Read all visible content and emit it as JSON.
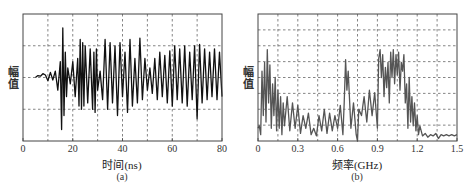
{
  "chart_data": [
    {
      "type": "line",
      "title": "",
      "panel_label": "(a)",
      "xlabel": "时间(ns)",
      "ylabel": "幅值",
      "xlim": [
        0,
        80
      ],
      "ylim": [
        -1,
        1
      ],
      "xticks": [
        "0",
        "20",
        "40",
        "60",
        "80"
      ],
      "xtick_values": [
        0,
        20,
        40,
        60,
        80
      ],
      "x_grid": [
        10,
        20,
        30,
        40,
        50,
        60,
        70
      ],
      "y_grid": [
        -0.5,
        0,
        0.5
      ],
      "grid": true,
      "line_color": "#111111",
      "description": "Time-domain waveform starting ~5 ns, small amplitude until ~14 ns, large burst ~15-17 ns (peak ~+0.78, trough ~-0.82), then sustained oscillations ±0.5 to 0.7 until 80 ns",
      "x": [
        5,
        6,
        7,
        8,
        9,
        10,
        11,
        12,
        13,
        14,
        15,
        15.5,
        16,
        16.5,
        17,
        17.5,
        18,
        19,
        20,
        21,
        22,
        22.5,
        23,
        23.5,
        24,
        24.5,
        25,
        26,
        27,
        28,
        28.5,
        29,
        29.5,
        30,
        31,
        32,
        33,
        34,
        35,
        36,
        37,
        38,
        39,
        40,
        41,
        42,
        43,
        44,
        45,
        46,
        47,
        48,
        49,
        50,
        51,
        52,
        53,
        54,
        55,
        56,
        57,
        58,
        59,
        60,
        61,
        62,
        63,
        64,
        65,
        66,
        67,
        68,
        69,
        70,
        71,
        72,
        73,
        74,
        75,
        76,
        77,
        78,
        79,
        80
      ],
      "y": [
        0.0,
        0.03,
        0.02,
        0.06,
        0.04,
        -0.05,
        0.08,
        -0.04,
        0.1,
        -0.2,
        0.25,
        -0.82,
        0.78,
        -0.6,
        0.4,
        -0.3,
        0.15,
        -0.1,
        0.25,
        -0.3,
        0.3,
        -0.45,
        0.6,
        -0.5,
        0.55,
        -0.45,
        0.5,
        -0.4,
        0.45,
        -0.5,
        0.4,
        -0.55,
        0.45,
        -0.2,
        0.1,
        -0.35,
        0.6,
        -0.5,
        0.55,
        -0.4,
        0.5,
        -0.6,
        0.55,
        -0.3,
        0.4,
        -0.55,
        0.6,
        -0.45,
        0.3,
        -0.4,
        0.62,
        -0.35,
        0.3,
        -0.2,
        0.15,
        -0.25,
        0.3,
        -0.35,
        0.4,
        -0.3,
        0.35,
        -0.4,
        0.42,
        -0.45,
        0.5,
        -0.35,
        0.45,
        -0.4,
        0.5,
        -0.45,
        0.4,
        -0.35,
        0.5,
        -0.65,
        0.52,
        -0.4,
        0.45,
        -0.35,
        0.4,
        -0.3,
        0.45,
        -0.35,
        0.4,
        -0.3
      ]
    },
    {
      "type": "line",
      "title": "",
      "panel_label": "(b)",
      "xlabel": "频率(GHz)",
      "ylabel": "幅值",
      "xlim": [
        0,
        1.5
      ],
      "ylim": [
        0,
        1
      ],
      "xticks": [
        "0",
        "0.3",
        "0.6",
        "0.9",
        "1.2",
        "1.5"
      ],
      "xtick_values": [
        0,
        0.3,
        0.6,
        0.9,
        1.2,
        1.5
      ],
      "x_grid": [
        0.15,
        0.3,
        0.45,
        0.6,
        0.75,
        0.9,
        1.05,
        1.2,
        1.35
      ],
      "y_grid": [
        0.125,
        0.25,
        0.375,
        0.5,
        0.625,
        0.75,
        0.875
      ],
      "grid": true,
      "line_color": "#555555",
      "description": "Spectrum with peaks near 0.05-0.08 GHz (~0.72), secondary peak ~0.67 GHz (~0.64), strong band 0.9-1.1 GHz (~0.72), drops to noise floor (~0.05) after 1.22 GHz",
      "x": [
        0,
        0.01,
        0.02,
        0.03,
        0.04,
        0.05,
        0.06,
        0.07,
        0.08,
        0.09,
        0.1,
        0.11,
        0.12,
        0.13,
        0.14,
        0.15,
        0.16,
        0.17,
        0.18,
        0.19,
        0.2,
        0.22,
        0.24,
        0.26,
        0.28,
        0.3,
        0.32,
        0.34,
        0.36,
        0.38,
        0.4,
        0.42,
        0.44,
        0.46,
        0.48,
        0.5,
        0.52,
        0.54,
        0.56,
        0.58,
        0.6,
        0.62,
        0.64,
        0.65,
        0.66,
        0.67,
        0.68,
        0.7,
        0.72,
        0.74,
        0.75,
        0.76,
        0.78,
        0.8,
        0.82,
        0.84,
        0.86,
        0.88,
        0.9,
        0.91,
        0.92,
        0.93,
        0.94,
        0.95,
        0.96,
        0.97,
        0.98,
        0.99,
        1.0,
        1.01,
        1.02,
        1.03,
        1.04,
        1.05,
        1.06,
        1.07,
        1.08,
        1.09,
        1.1,
        1.11,
        1.12,
        1.13,
        1.14,
        1.15,
        1.16,
        1.17,
        1.18,
        1.19,
        1.2,
        1.21,
        1.22,
        1.24,
        1.26,
        1.28,
        1.3,
        1.32,
        1.34,
        1.36,
        1.38,
        1.4,
        1.42,
        1.44,
        1.46,
        1.48,
        1.5
      ],
      "y": [
        0.1,
        0.12,
        0.05,
        0.55,
        0.2,
        0.62,
        0.15,
        0.72,
        0.3,
        0.6,
        0.1,
        0.45,
        0.2,
        0.5,
        0.08,
        0.4,
        0.1,
        0.35,
        0.05,
        0.3,
        0.12,
        0.35,
        0.08,
        0.3,
        0.1,
        0.28,
        0.06,
        0.2,
        0.1,
        0.22,
        0.05,
        0.1,
        0.04,
        0.2,
        0.08,
        0.25,
        0.06,
        0.22,
        0.08,
        0.2,
        0.1,
        0.28,
        0.05,
        0.3,
        0.64,
        0.4,
        0.55,
        0.1,
        0.3,
        0.05,
        0.0,
        0.25,
        0.2,
        0.35,
        0.15,
        0.4,
        0.2,
        0.38,
        0.1,
        0.65,
        0.72,
        0.5,
        0.68,
        0.35,
        0.58,
        0.42,
        0.62,
        0.3,
        0.7,
        0.5,
        0.72,
        0.45,
        0.68,
        0.52,
        0.7,
        0.4,
        0.62,
        0.55,
        0.68,
        0.3,
        0.45,
        0.1,
        0.5,
        0.15,
        0.35,
        0.12,
        0.3,
        0.08,
        0.2,
        0.05,
        0.12,
        0.04,
        0.06,
        0.03,
        0.05,
        0.04,
        0.06,
        0.02,
        0.05,
        0.04,
        0.05,
        0.04,
        0.05,
        0.04,
        0.05
      ]
    }
  ],
  "panels": {
    "a": {
      "ylabel": "幅值",
      "xlabel": "时间(ns)",
      "sub": "(a)",
      "ticks": [
        "0",
        "20",
        "40",
        "60",
        "80"
      ]
    },
    "b": {
      "ylabel": "幅值",
      "xlabel": "频率(GHz)",
      "sub": "(b)",
      "ticks": [
        "0",
        "0.3",
        "0.6",
        "0.9",
        "1.2",
        "1.5"
      ]
    }
  }
}
